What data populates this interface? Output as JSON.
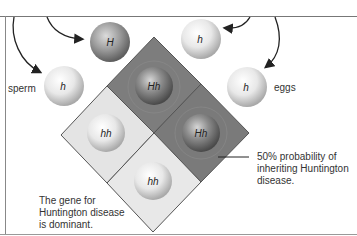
{
  "diagram": {
    "labels": {
      "sperm": "sperm",
      "eggs": "eggs",
      "probability": [
        "50% probability of",
        "inheriting Huntington",
        "disease."
      ],
      "dominant": [
        "The gene for",
        "Huntington disease",
        "is dominant."
      ]
    },
    "gametes": {
      "sperm_top": "H",
      "sperm_left": "h",
      "egg_top": "h",
      "egg_right": "h"
    },
    "offspring": {
      "top": "Hh",
      "right": "Hh",
      "left": "hh",
      "bottom": "hh"
    },
    "colors": {
      "affected_cell": "#7d7d7d",
      "unaffected_cell": "#e6e6e6",
      "dominant_ball": "#8a8a8a",
      "recessive_ball": "#e8e8e8",
      "border": "#555555"
    }
  }
}
